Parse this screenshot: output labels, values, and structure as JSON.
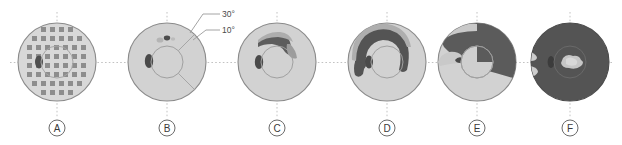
{
  "figure": {
    "title": "",
    "background_color": "#ffffff",
    "panel_count": 6
  },
  "annotations": {
    "outer_ring_label": "30°",
    "inner_ring_label": "10°"
  },
  "colors": {
    "field_light": "#d6d6d6",
    "field_mid": "#9a9a9a",
    "field_dark": "#5d5d5d",
    "grid_square": "#8d8d8d",
    "outline": "#8a8a8a",
    "axis": "#b9b9b9",
    "label_text": "#3a3a3a",
    "blind_spot": "#4a4a4a"
  },
  "panels": [
    {
      "id": "A",
      "label": "A",
      "center_x": 57,
      "center_y": 62,
      "outer_radius": 39,
      "inner_radius": 16,
      "description": "normal-field-grayscale-grid"
    },
    {
      "id": "B",
      "label": "B",
      "center_x": 167,
      "center_y": 62,
      "outer_radius": 39,
      "inner_radius": 16,
      "description": "early-superior-paracentral-defect"
    },
    {
      "id": "C",
      "label": "C",
      "center_x": 277,
      "center_y": 62,
      "outer_radius": 39,
      "inner_radius": 16,
      "description": "superior-arcuate-scotoma"
    },
    {
      "id": "D",
      "label": "D",
      "center_x": 387,
      "center_y": 62,
      "outer_radius": 39,
      "inner_radius": 16,
      "description": "dense-superior-arcuate-defect"
    },
    {
      "id": "E",
      "label": "E",
      "center_x": 477,
      "center_y": 62,
      "outer_radius": 39,
      "inner_radius": 16,
      "description": "superior-hemifield-loss-with-nasal-step"
    },
    {
      "id": "F",
      "label": "F",
      "center_x": 570,
      "center_y": 62,
      "outer_radius": 39,
      "inner_radius": 16,
      "description": "end-stage-central-island-only"
    }
  ],
  "grid_pattern": {
    "rows": 8,
    "square_size": 5,
    "spacing": 9,
    "counts_per_row": [
      4,
      6,
      8,
      8,
      8,
      8,
      6,
      4
    ]
  }
}
